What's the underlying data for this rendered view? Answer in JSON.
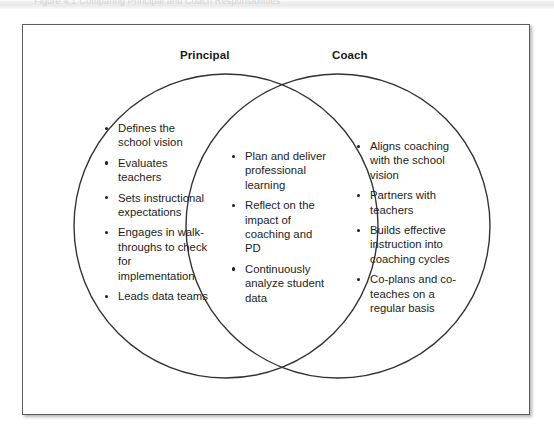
{
  "page": {
    "top_strip_ghost_text": "Figure 4.1     Comparing Principal and Coach Responsibilities"
  },
  "figure": {
    "type": "venn-diagram",
    "left_circle": {
      "label": "Principal",
      "items": [
        "Defines the school vision",
        "Evaluates teachers",
        "Sets instructional expectations",
        "Engages in walk-throughs to check for implementation",
        "Leads data teams"
      ]
    },
    "overlap": {
      "label": "",
      "items": [
        "Plan and deliver professional learning",
        "Reflect on the impact of coaching and PD",
        "Continuously analyze student data"
      ]
    },
    "right_circle": {
      "label": "Coach",
      "items": [
        "Aligns coaching with the school vision",
        "Partners with teachers",
        "Builds effective instruction into coaching cycles",
        "Co-plans and co-teaches on a regular basis"
      ]
    },
    "colors": {
      "stroke": "#333333",
      "panel_border": "#5d5d5d",
      "text": "#1d1d1d",
      "background": "#ffffff"
    }
  }
}
